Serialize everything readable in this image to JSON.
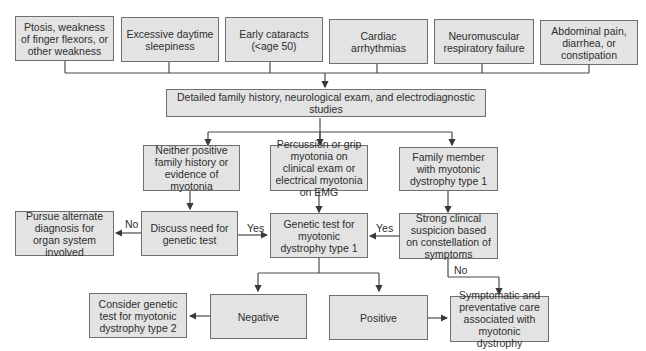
{
  "symptoms": [
    "Ptosis, weakness of finger flexors, or other weakness",
    "Excessive daytime sleepiness",
    "Early cataracts (<age 50)",
    "Cardiac arrhythmias",
    "Neuromuscular respiratory failure",
    "Abdominal pain, diarrhea, or constipation"
  ],
  "evaluation": "Detailed family history, neurological exam, and electrodiagnostic studies",
  "branches": {
    "neither": "Neither positive family history or evidence of myotonia",
    "myotonia": "Percussion or grip myotonia on clinical exam or electrical myotonia on EMG",
    "family": "Family member with myotonic dystrophy type 1"
  },
  "discuss": "Discuss need for genetic test",
  "alternate": "Pursue alternate diagnosis for organ system involved",
  "genetic_test": "Genetic test for myotonic dystrophy type 1",
  "suspicion": "Strong clinical suspicion based on constellation of symptoms",
  "negative": "Negative",
  "positive": "Positive",
  "consider_type2": "Consider genetic test for myotonic dystrophy type 2",
  "care": "Symptomatic and preventative care associated with myotonic dystrophy",
  "labels": {
    "no1": "No",
    "yes1": "Yes",
    "yes2": "Yes",
    "no2": "No"
  }
}
